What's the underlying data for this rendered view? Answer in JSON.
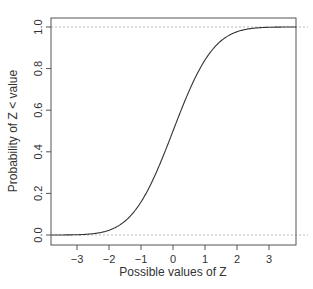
{
  "chart_data": {
    "type": "line",
    "title": "",
    "xlabel": "Possible values of Z",
    "ylabel": "Probability of Z < value",
    "xlim": [
      -3.8,
      3.85
    ],
    "ylim": [
      -0.04,
      1.04
    ],
    "xticks": [
      -3,
      -2,
      -1,
      0,
      1,
      2,
      3
    ],
    "xtick_labels": [
      "−3",
      "−2",
      "−1",
      "0",
      "1",
      "2",
      "3"
    ],
    "yticks": [
      0.0,
      0.2,
      0.4,
      0.6,
      0.8,
      1.0
    ],
    "ytick_labels": [
      "0.0",
      "0.2",
      "0.4",
      "0.6",
      "0.8",
      "1.0"
    ],
    "grid": false,
    "reference_lines": [
      {
        "y": 0.0,
        "style": "dotted",
        "color": "#bbbbbb"
      },
      {
        "y": 1.0,
        "style": "dotted",
        "color": "#bbbbbb"
      }
    ],
    "series": [
      {
        "name": "Standard normal CDF",
        "color": "#333333",
        "x": [
          -3.8,
          -3.5,
          -3.0,
          -2.5,
          -2.0,
          -1.5,
          -1.0,
          -0.5,
          0.0,
          0.5,
          1.0,
          1.5,
          2.0,
          2.5,
          3.0,
          3.5,
          3.85
        ],
        "values": [
          0.0001,
          0.0002,
          0.0013,
          0.0062,
          0.0228,
          0.0668,
          0.1587,
          0.3085,
          0.5,
          0.6915,
          0.8413,
          0.9332,
          0.9772,
          0.9938,
          0.9987,
          0.9998,
          0.9999
        ]
      }
    ]
  }
}
